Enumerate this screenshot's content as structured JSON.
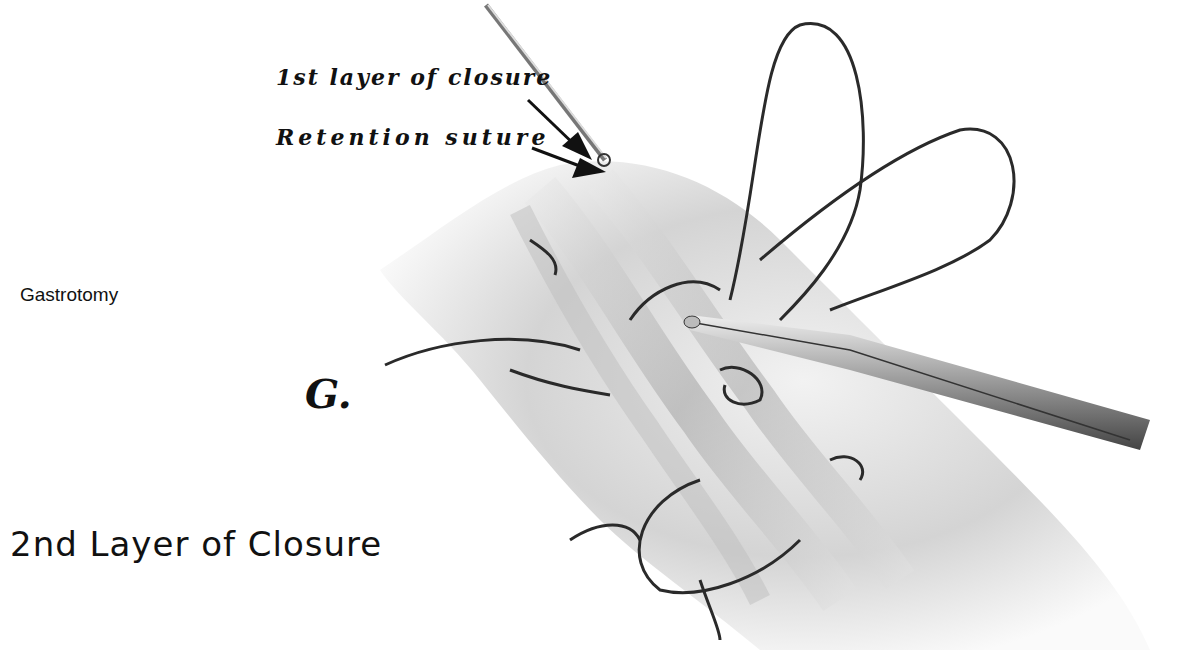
{
  "figure": {
    "panel_letter": "G.",
    "section_label": "Gastrotomy",
    "caption": "2nd Layer of Closure",
    "callouts": [
      {
        "label": "1st layer of closure"
      },
      {
        "label": "Retention suture"
      }
    ],
    "illustration": "Stomach wall with two-layer gastrotomy closure; sutures held by needle holder and forceps"
  }
}
